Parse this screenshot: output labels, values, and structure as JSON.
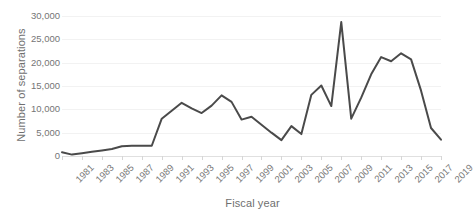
{
  "chart_data": {
    "type": "line",
    "title": "",
    "xlabel": "Fiscal year",
    "ylabel": "Number of separations",
    "x": [
      1981,
      1982,
      1983,
      1984,
      1985,
      1986,
      1987,
      1988,
      1989,
      1990,
      1991,
      1992,
      1993,
      1994,
      1995,
      1996,
      1997,
      1998,
      1999,
      2000,
      2001,
      2002,
      2003,
      2004,
      2005,
      2006,
      2007,
      2008,
      2009,
      2010,
      2011,
      2012,
      2013,
      2014,
      2015,
      2016,
      2017,
      2018,
      2019
    ],
    "values": [
      800,
      300,
      600,
      900,
      1200,
      1500,
      2100,
      2200,
      2200,
      2200,
      8000,
      9700,
      11400,
      10200,
      9200,
      10800,
      13000,
      11600,
      7800,
      8400,
      6700,
      5000,
      3400,
      6400,
      4700,
      13100,
      15100,
      10700,
      28700,
      8000,
      12500,
      17500,
      21200,
      20300,
      22000,
      20700,
      14000,
      6000,
      3500
    ],
    "xtick_labels": [
      "1981",
      "1983",
      "1985",
      "1987",
      "1989",
      "1991",
      "1993",
      "1995",
      "1997",
      "1999",
      "2001",
      "2003",
      "2005",
      "2007",
      "2009",
      "2011",
      "2013",
      "2015",
      "2017",
      "2019"
    ],
    "ytick_labels": [
      "0",
      "5,000",
      "10,000",
      "15,000",
      "20,000",
      "25,000",
      "30,000"
    ],
    "ytick_values": [
      0,
      5000,
      10000,
      15000,
      20000,
      25000,
      30000
    ],
    "ylim": [
      0,
      30000
    ],
    "xlim": [
      1981,
      2019
    ],
    "grid": true,
    "legend": "none",
    "line_color": "#4a4a4a",
    "gridline_color": "#f2f2f2",
    "axis_text_color": "#757575",
    "background_color": "#ffffff"
  }
}
